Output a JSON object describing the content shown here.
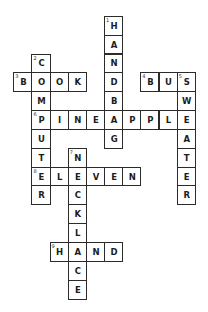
{
  "puzzle": {
    "type": "crossword",
    "colors": {
      "border": "#2b2b2b",
      "letter": "#1c1c1c",
      "background": "#ffffff"
    },
    "entries": [
      {
        "number": 1,
        "direction": "down",
        "answer": "HANDBAG",
        "row": 0,
        "col": 5
      },
      {
        "number": 2,
        "direction": "down",
        "answer": "COMPUTER",
        "row": 2,
        "col": 1
      },
      {
        "number": 3,
        "direction": "across",
        "answer": "BOOK",
        "row": 3,
        "col": 0
      },
      {
        "number": 4,
        "direction": "across",
        "answer": "BUS",
        "row": 3,
        "col": 7
      },
      {
        "number": 5,
        "direction": "down",
        "answer": "SWEATER",
        "row": 3,
        "col": 9
      },
      {
        "number": 6,
        "direction": "across",
        "answer": "PINEAPPLE",
        "row": 5,
        "col": 1
      },
      {
        "number": 7,
        "direction": "down",
        "answer": "NECKLACE",
        "row": 7,
        "col": 3
      },
      {
        "number": 8,
        "direction": "across",
        "answer": "ELEVEN",
        "row": 8,
        "col": 1
      },
      {
        "number": 9,
        "direction": "across",
        "answer": "HAND",
        "row": 12,
        "col": 2
      }
    ]
  }
}
